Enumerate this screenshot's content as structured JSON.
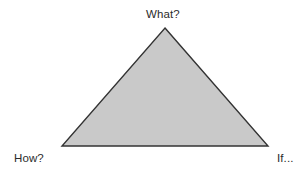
{
  "canvas": {
    "width": 298,
    "height": 174,
    "background_color": "#ffffff"
  },
  "diagram": {
    "type": "triangle",
    "shape": {
      "name": "triangle",
      "fill_color": "#c9c9c9",
      "stroke_color": "#333333",
      "stroke_width": 1.4,
      "apex": {
        "x": 165,
        "y": 28
      },
      "bottom_left": {
        "x": 62,
        "y": 146
      },
      "bottom_right": {
        "x": 268,
        "y": 146
      }
    },
    "labels": {
      "top": "What?",
      "bottom_left": "How?",
      "bottom_right": "If..."
    }
  }
}
